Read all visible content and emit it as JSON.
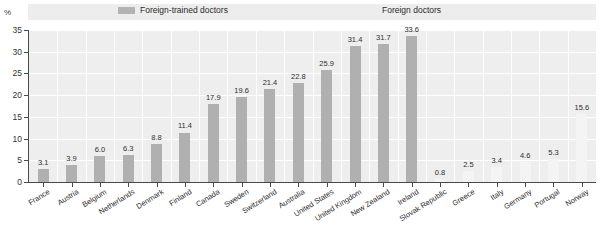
{
  "chart_data": {
    "type": "bar",
    "title": "",
    "subtitle": "",
    "xlabel": "",
    "ylabel": "%",
    "ylim": [
      0,
      35
    ],
    "yticks": [
      0,
      5,
      10,
      15,
      20,
      25,
      30,
      35
    ],
    "grid": true,
    "legend_position": "top",
    "categories": [
      "France",
      "Austria",
      "Belgium",
      "Netherlands",
      "Denmark",
      "Finland",
      "Canada",
      "Sweden",
      "Switzerland",
      "Australia",
      "United States",
      "United Kingdom",
      "New Zealand",
      "Ireland",
      "Slovak Republic",
      "Greece",
      "Italy",
      "Germany",
      "Portugal",
      "Norway"
    ],
    "series": [
      {
        "name": "Foreign-trained doctors",
        "values": [
          3.1,
          3.9,
          6.0,
          6.3,
          8.8,
          11.4,
          17.9,
          19.6,
          21.4,
          22.8,
          25.9,
          31.4,
          31.7,
          33.6,
          null,
          null,
          null,
          null,
          null,
          null
        ]
      },
      {
        "name": "Foreign doctors",
        "values": [
          null,
          null,
          null,
          null,
          null,
          null,
          null,
          null,
          null,
          null,
          null,
          null,
          null,
          null,
          0.8,
          2.5,
          3.4,
          4.6,
          5.3,
          15.6
        ]
      }
    ],
    "value_labels": [
      "3.1",
      "3.9",
      "6.0",
      "6.3",
      "8.8",
      "11.4",
      "17.9",
      "19.6",
      "21.4",
      "22.8",
      "25.9",
      "31.4",
      "31.7",
      "33.6",
      "0.8",
      "2.5",
      "3.4",
      "4.6",
      "5.3",
      "15.6"
    ]
  },
  "legend": {
    "entries": [
      {
        "label": "Foreign-trained doctors",
        "color": "#b0b0b0"
      },
      {
        "label": "Foreign doctors",
        "color": "#f4f4f4"
      }
    ]
  },
  "axis": {
    "unit": "%",
    "tick_labels": [
      "35",
      "30",
      "25",
      "20",
      "15",
      "10",
      "5",
      "0"
    ]
  },
  "colors": {
    "bar_dark": "#b0b0b0",
    "bar_light": "#f4f4f4",
    "plot_background": "#eeeeee",
    "legend_band": "#ededed",
    "gridline": "#ffffff",
    "axis": "#4a4a4a",
    "text": "#2e2e2e"
  }
}
